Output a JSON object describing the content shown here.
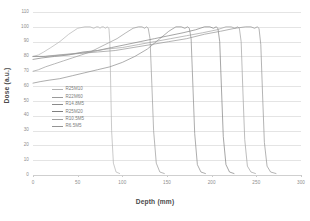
{
  "chart_data": {
    "type": "line",
    "title": "",
    "xlabel": "Depth (mm)",
    "ylabel": "Dose (a.u.)",
    "xlim": [
      0,
      300
    ],
    "ylim": [
      0,
      110
    ],
    "xticks": [
      0,
      50,
      100,
      150,
      200,
      250,
      300
    ],
    "yticks": [
      0,
      10,
      20,
      30,
      40,
      50,
      60,
      70,
      80,
      90,
      100,
      110
    ],
    "grid": true,
    "legend_position": "center-left",
    "series": [
      {
        "name": "R25M10",
        "color": "#b3b3b3",
        "x": [
          0,
          6,
          12,
          20,
          30,
          40,
          50,
          58,
          64,
          68,
          71,
          73,
          75,
          77,
          79,
          81,
          83,
          85,
          86,
          87,
          88,
          90,
          93,
          97
        ],
        "y": [
          80,
          81,
          83,
          86,
          90,
          95,
          99,
          100,
          100,
          99,
          100,
          100,
          99,
          100,
          100,
          99,
          100,
          99,
          90,
          60,
          30,
          8,
          2,
          1
        ]
      },
      {
        "name": "R22M60",
        "color": "#9a9a9a",
        "x": [
          0,
          6,
          14,
          24,
          34,
          44,
          54,
          64,
          74,
          84,
          94,
          104,
          112,
          118,
          122,
          125,
          127,
          129,
          131,
          133,
          135,
          138,
          142,
          147
        ],
        "y": [
          70,
          71,
          73,
          75,
          77,
          79,
          81,
          83,
          86,
          89,
          92,
          96,
          99,
          100,
          100,
          99,
          100,
          99,
          92,
          62,
          30,
          8,
          2,
          1
        ]
      },
      {
        "name": "R14.8M5",
        "color": "#8a8a8a",
        "x": [
          0,
          8,
          18,
          30,
          44,
          58,
          72,
          86,
          100,
          114,
          128,
          142,
          152,
          160,
          166,
          170,
          173,
          175,
          177,
          179,
          181,
          184,
          188,
          193
        ],
        "y": [
          62,
          63,
          64,
          65,
          67,
          69,
          71,
          73,
          76,
          80,
          85,
          92,
          97,
          100,
          100,
          99,
          100,
          99,
          92,
          60,
          28,
          7,
          2,
          1
        ]
      },
      {
        "name": "R25M20",
        "color": "#7f7f7f",
        "x": [
          0,
          10,
          24,
          40,
          56,
          72,
          88,
          104,
          120,
          136,
          152,
          168,
          182,
          192,
          198,
          202,
          205,
          207,
          209,
          211,
          213,
          216,
          220,
          225
        ],
        "y": [
          78,
          79,
          80,
          81,
          83,
          84,
          86,
          88,
          90,
          92,
          94,
          96,
          98,
          100,
          100,
          99,
          100,
          99,
          90,
          58,
          26,
          7,
          2,
          1
        ]
      },
      {
        "name": "R10.5M5",
        "color": "#a0a0a0",
        "x": [
          0,
          12,
          28,
          46,
          64,
          82,
          100,
          118,
          136,
          154,
          172,
          190,
          206,
          216,
          222,
          226,
          229,
          231,
          233,
          235,
          237,
          240,
          244,
          249
        ],
        "y": [
          80,
          80,
          81,
          82,
          83,
          85,
          86,
          88,
          90,
          92,
          94,
          96,
          98,
          100,
          100,
          99,
          100,
          99,
          90,
          56,
          24,
          6,
          2,
          1
        ]
      },
      {
        "name": "R6.5M5",
        "color": "#949494",
        "x": [
          0,
          14,
          32,
          52,
          72,
          92,
          112,
          132,
          152,
          172,
          192,
          210,
          226,
          238,
          244,
          248,
          251,
          253,
          255,
          257,
          259,
          262,
          266,
          272
        ],
        "y": [
          80,
          80,
          81,
          82,
          83,
          84,
          86,
          88,
          90,
          92,
          95,
          97,
          99,
          100,
          100,
          99,
          100,
          99,
          88,
          54,
          22,
          6,
          2,
          1
        ]
      }
    ]
  },
  "legend": {
    "items": [
      {
        "label": "R25M10",
        "color": "#b3b3b3"
      },
      {
        "label": "R22M60",
        "color": "#9a9a9a"
      },
      {
        "label": "R14.8M5",
        "color": "#8a8a8a"
      },
      {
        "label": "R25M20",
        "color": "#7f7f7f"
      },
      {
        "label": "R10.5M5",
        "color": "#a0a0a0"
      },
      {
        "label": "R6.5M5",
        "color": "#949494"
      }
    ]
  },
  "axes": {
    "x_title": "Depth (mm)",
    "y_title": "Dose (a.u.)",
    "x_ticks": [
      "0",
      "50",
      "100",
      "150",
      "200",
      "250",
      "300"
    ],
    "y_ticks": [
      "110",
      "100",
      "90",
      "80",
      "70",
      "60",
      "50",
      "40",
      "30",
      "20",
      "10",
      "0"
    ]
  }
}
